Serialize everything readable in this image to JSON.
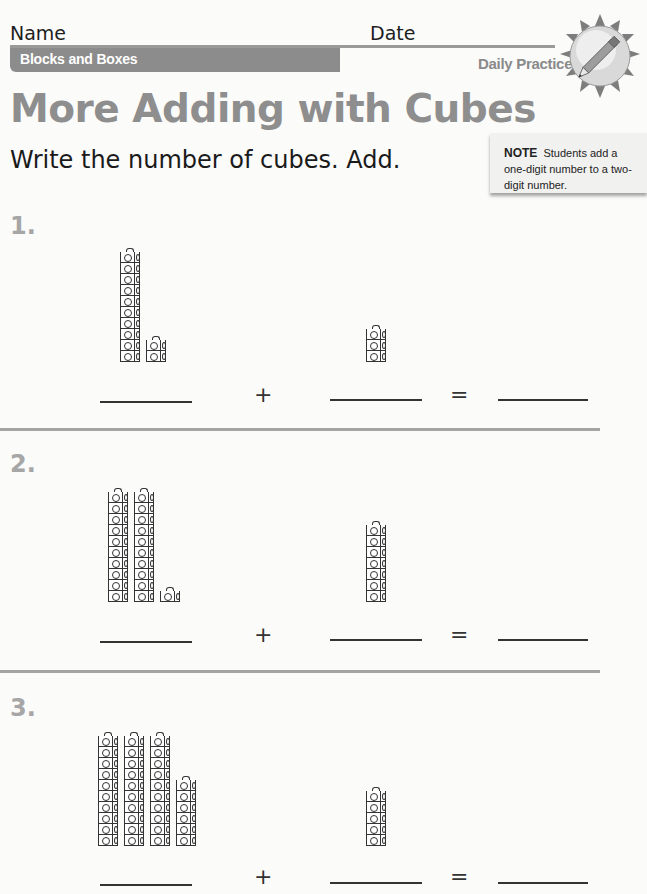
{
  "header": {
    "name_label": "Name",
    "date_label": "Date",
    "unit_banner": "Blocks and Boxes",
    "daily_practice": "Daily Practice",
    "badge_icon": "pencil-sun-icon"
  },
  "title": "More Adding with Cubes",
  "instructions": "Write the number of cubes. Add.",
  "note": {
    "label": "NOTE",
    "text": "Students add a one-digit number to a two-digit number."
  },
  "operators": {
    "plus": "+",
    "equals": "="
  },
  "problems": [
    {
      "number": "1.",
      "left": {
        "tens": 1,
        "ones": 2
      },
      "right": {
        "ones": 3
      },
      "answers": [
        "",
        "",
        ""
      ]
    },
    {
      "number": "2.",
      "left": {
        "tens": 2,
        "ones": 1
      },
      "right": {
        "ones": 7
      },
      "answers": [
        "",
        "",
        ""
      ]
    },
    {
      "number": "3.",
      "left": {
        "tens": 3,
        "ones": 6
      },
      "right": {
        "ones": 5
      },
      "answers": [
        "",
        "",
        ""
      ]
    }
  ]
}
